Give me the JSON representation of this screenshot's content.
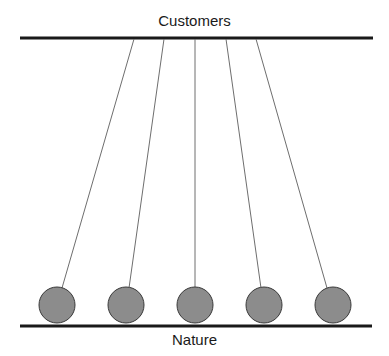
{
  "diagram": {
    "top_label": "Customers",
    "bottom_label": "Nature",
    "colors": {
      "bar": "#1a1a1a",
      "string": "#6e6e6e",
      "ball_fill": "#8c8c8c",
      "ball_stroke": "#3a3a3a",
      "text": "#1a1a1a"
    },
    "top_bar": {
      "x1": 20,
      "x2": 373,
      "y": 38
    },
    "bottom_bar": {
      "x1": 20,
      "x2": 372,
      "y": 326
    },
    "balls": [
      {
        "id": 1,
        "cx": 57,
        "cy": 305,
        "r": 18,
        "string_top_x": 134,
        "string_bottom_x": 62
      },
      {
        "id": 2,
        "cx": 126,
        "cy": 305,
        "r": 18,
        "string_top_x": 164,
        "string_bottom_x": 129
      },
      {
        "id": 3,
        "cx": 195,
        "cy": 305,
        "r": 18,
        "string_top_x": 195,
        "string_bottom_x": 195
      },
      {
        "id": 4,
        "cx": 264,
        "cy": 305,
        "r": 18,
        "string_top_x": 226,
        "string_bottom_x": 261
      },
      {
        "id": 5,
        "cx": 333,
        "cy": 305,
        "r": 18,
        "string_top_x": 256,
        "string_bottom_x": 327
      }
    ]
  }
}
